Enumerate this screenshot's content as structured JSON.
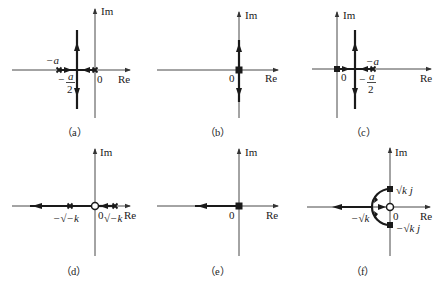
{
  "figure": {
    "panels": [
      {
        "id": "a",
        "caption": "（a）",
        "axis_labels": {
          "re": "Re",
          "im": "Im",
          "origin": "0"
        },
        "annotations": {
          "pole": "−a",
          "breakaway_num": "a",
          "breakaway_den": "2",
          "breakaway_sign": "−"
        }
      },
      {
        "id": "b",
        "caption": "（b）",
        "axis_labels": {
          "re": "Re",
          "im": "Im",
          "origin": "0"
        }
      },
      {
        "id": "c",
        "caption": "（c）",
        "axis_labels": {
          "re": "Re",
          "im": "Im",
          "origin": "0"
        },
        "annotations": {
          "pole": "−a",
          "breakaway_num": "a",
          "breakaway_den": "2",
          "breakaway_sign": "−"
        }
      },
      {
        "id": "d",
        "caption": "（d）",
        "axis_labels": {
          "re": "Re",
          "im": "Im",
          "origin": "0"
        },
        "annotations": {
          "left_pole": "−√−k",
          "right_pole": "√−k"
        }
      },
      {
        "id": "e",
        "caption": "（e）",
        "axis_labels": {
          "re": "Re",
          "im": "Im",
          "origin": "0"
        }
      },
      {
        "id": "f",
        "caption": "（f）",
        "axis_labels": {
          "re": "Re",
          "im": "Im",
          "origin": "0"
        },
        "annotations": {
          "upper_pole": "√k j",
          "lower_pole": "−√k j",
          "breakin": "−√k"
        }
      }
    ]
  }
}
